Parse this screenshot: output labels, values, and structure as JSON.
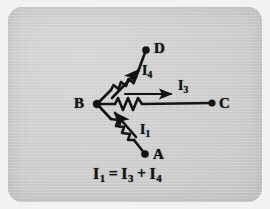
{
  "figure": {
    "kind": "circuit-diagram",
    "title_text": "",
    "background_color": "#cccccc",
    "ink_color": "#141414",
    "nodes": [
      {
        "id": "A",
        "label": "A",
        "x": 137,
        "y": 147,
        "label_x": 147,
        "label_y": 148
      },
      {
        "id": "B",
        "label": "B",
        "x": 89,
        "y": 97,
        "label_x": 70,
        "label_y": 96
      },
      {
        "id": "C",
        "label": "C",
        "x": 204,
        "y": 96,
        "label_x": 214,
        "label_y": 96
      },
      {
        "id": "D",
        "label": "D",
        "x": 138,
        "y": 43,
        "label_x": 149,
        "label_y": 42
      }
    ],
    "branches": [
      {
        "id": "branch-BD",
        "from": "B",
        "to": "D",
        "component": "resistor",
        "current_label": "I4",
        "current_symbol": "I",
        "current_subscript": "4",
        "current_direction": "B-to-D",
        "label_x": 140,
        "label_y": 65
      },
      {
        "id": "branch-BC",
        "from": "B",
        "to": "C",
        "component": "resistor",
        "current_label": "I3",
        "current_symbol": "I",
        "current_subscript": "3",
        "current_direction": "B-to-C",
        "label_x": 174,
        "label_y": 80
      },
      {
        "id": "branch-AB",
        "from": "A",
        "to": "B",
        "component": "resistor",
        "current_label": "I1",
        "current_symbol": "I",
        "current_subscript": "1",
        "current_direction": "A-to-B",
        "label_x": 137,
        "label_y": 124
      }
    ],
    "equation": {
      "text": "I1 = I3 + I4",
      "terms": [
        "I",
        "1",
        "=",
        "I",
        "3",
        "+",
        "I",
        "4"
      ],
      "x": 93,
      "y": 168
    }
  }
}
